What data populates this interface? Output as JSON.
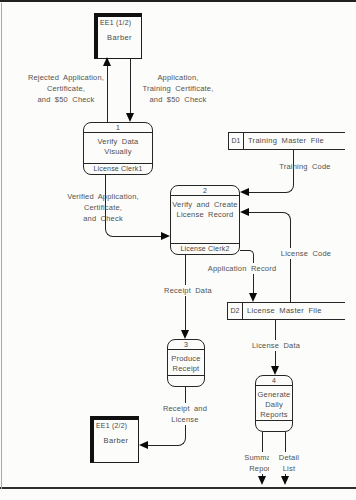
{
  "entities": [
    {
      "code": "EE1 (1/2)",
      "name": "Barber"
    },
    {
      "code": "EE1 (2/2)",
      "name": "Barber"
    }
  ],
  "processes": [
    {
      "number": "1",
      "name": "Verify Data\nVisually",
      "actor": "License Clerk1"
    },
    {
      "number": "2",
      "name": "Verify and Create\nLicense Record",
      "actor": "License Clerk2"
    },
    {
      "number": "3",
      "name": "Produce\nReceipt",
      "actor": ""
    },
    {
      "number": "4",
      "name": "Generate\nDaily\nReports",
      "actor": ""
    }
  ],
  "data_stores": [
    {
      "id": "D1",
      "name": "Training Master File"
    },
    {
      "id": "D2",
      "name": "License Master File"
    }
  ],
  "flows": {
    "rejected": "Rejected Application,\nCertificate,\nand $50 Check",
    "application": "Application,\nTraining Certificate,\nand $50 Check",
    "verified": "Verified Application,\nCertificate,\nand Check",
    "training_code": "Training Code",
    "license_code": "License Code",
    "application_record": "Application Record",
    "receipt_data": "Receipt Data",
    "receipt_license": "Receipt and\nLicense",
    "license_data": "License Data",
    "summary_report": "Summary\nReport",
    "detail_list": "Detail\nList"
  }
}
